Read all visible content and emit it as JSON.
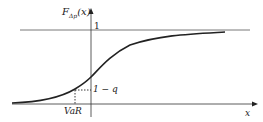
{
  "diagram": {
    "title": "",
    "y_axis_label": "F_{Δp}(x)",
    "y_axis_label_main": "F",
    "y_axis_label_sub": "Δp",
    "y_axis_label_arg": "(x)",
    "x_axis_label": "x",
    "asymptote_label": "1",
    "quantile_level_label": "1 − q",
    "quantile_point_label": "VaR",
    "colors": {
      "line": "#222222",
      "asymptote": "#555555"
    }
  }
}
